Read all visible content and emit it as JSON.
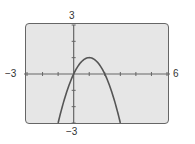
{
  "chart_data": {
    "type": "line",
    "title": "",
    "xlabel": "",
    "ylabel": "",
    "xlim": [
      -3,
      6
    ],
    "ylim": [
      -3,
      3
    ],
    "xscale": 1,
    "yscale": 1,
    "grid": false,
    "function": "y = 2x - x^2",
    "series": [
      {
        "name": "parabola",
        "x": [
          -1,
          -0.5,
          0,
          0.5,
          1,
          1.5,
          2,
          2.5,
          3
        ],
        "y": [
          -3,
          -1.25,
          0,
          0.75,
          1,
          0.75,
          0,
          -1.25,
          -3
        ]
      }
    ],
    "window_labels": {
      "xmin": "−3",
      "xmax": "6",
      "ymin": "−3",
      "ymax": "3"
    },
    "colors": {
      "screen": "#e6e6e6",
      "curve": "#555555",
      "axes": "#666666"
    }
  }
}
